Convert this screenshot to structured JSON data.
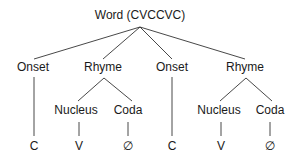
{
  "diagram": {
    "type": "syllable-structure-tree",
    "root": {
      "label": "Word (CVCCVC)"
    },
    "level1": [
      {
        "label": "Onset"
      },
      {
        "label": "Rhyme"
      },
      {
        "label": "Onset"
      },
      {
        "label": "Rhyme"
      }
    ],
    "level2": [
      {
        "label": "Nucleus"
      },
      {
        "label": "Coda"
      },
      {
        "label": "Nucleus"
      },
      {
        "label": "Coda"
      }
    ],
    "leaves": [
      {
        "label": "C"
      },
      {
        "label": "V"
      },
      {
        "label": "∅"
      },
      {
        "label": "C"
      },
      {
        "label": "V"
      },
      {
        "label": "∅"
      }
    ],
    "line_color": "#333333"
  }
}
